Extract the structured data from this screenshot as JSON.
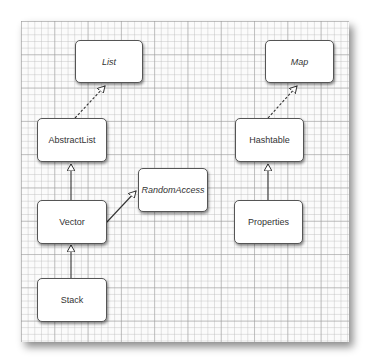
{
  "diagram": {
    "type": "UML class hierarchy",
    "nodes": [
      {
        "id": "list",
        "label": "List",
        "kind": "interface"
      },
      {
        "id": "abstractlist",
        "label": "AbstractList",
        "kind": "class"
      },
      {
        "id": "vector",
        "label": "Vector",
        "kind": "class"
      },
      {
        "id": "stack",
        "label": "Stack",
        "kind": "class"
      },
      {
        "id": "randomaccess",
        "label": "RandomAccess",
        "kind": "interface"
      },
      {
        "id": "map",
        "label": "Map",
        "kind": "interface"
      },
      {
        "id": "hashtable",
        "label": "Hashtable",
        "kind": "class"
      },
      {
        "id": "properties",
        "label": "Properties",
        "kind": "class"
      }
    ],
    "edges": [
      {
        "from": "abstractlist",
        "to": "list",
        "style": "dashed",
        "relation": "implements"
      },
      {
        "from": "vector",
        "to": "abstractlist",
        "style": "solid",
        "relation": "extends"
      },
      {
        "from": "vector",
        "to": "randomaccess",
        "style": "solid",
        "relation": "implements"
      },
      {
        "from": "stack",
        "to": "vector",
        "style": "solid",
        "relation": "extends"
      },
      {
        "from": "hashtable",
        "to": "map",
        "style": "dashed",
        "relation": "implements"
      },
      {
        "from": "properties",
        "to": "hashtable",
        "style": "solid",
        "relation": "extends"
      }
    ]
  }
}
